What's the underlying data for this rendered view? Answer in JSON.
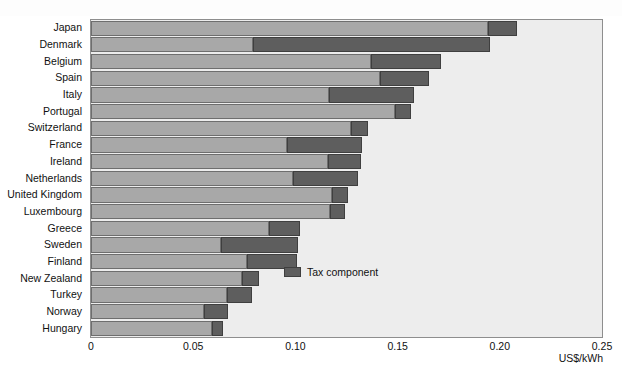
{
  "chart": {
    "type": "bar",
    "orientation": "horizontal",
    "xlabel": "US$/kWh",
    "ylabel": "",
    "title": "",
    "xlim": [
      0,
      0.25
    ],
    "xticks": [
      "0",
      "0.05",
      "0.10",
      "0.15",
      "0.20",
      "0.25"
    ],
    "xtick_values": [
      0,
      0.05,
      0.1,
      0.15,
      0.2,
      0.25
    ],
    "grid": false,
    "legend": {
      "position": "inside-center-right",
      "entries": [
        {
          "label": "Tax component",
          "color": "#5e5e5e"
        }
      ]
    },
    "colors": {
      "base": "#a8a8a8",
      "tax": "#5e5e5e",
      "plot_background": "#ededed",
      "frame": "#8e8e8e"
    },
    "series": [
      {
        "name": "Price excluding tax",
        "color": "#a8a8a8"
      },
      {
        "name": "Tax component",
        "color": "#5e5e5e"
      }
    ],
    "categories": [
      "Japan",
      "Denmark",
      "Belgium",
      "Spain",
      "Italy",
      "Portugal",
      "Switzerland",
      "France",
      "Ireland",
      "Netherlands",
      "United Kingdom",
      "Luxembourg",
      "Greece",
      "Sweden",
      "Finland",
      "New Zealand",
      "Turkey",
      "Norway",
      "Hungary"
    ],
    "rows": [
      {
        "category": "Japan",
        "base": 0.1944,
        "tax": 0.0142,
        "total": 0.2086
      },
      {
        "category": "Denmark",
        "base": 0.0794,
        "tax": 0.116,
        "total": 0.1954
      },
      {
        "category": "Belgium",
        "base": 0.1369,
        "tax": 0.0341,
        "total": 0.171
      },
      {
        "category": "Spain",
        "base": 0.1413,
        "tax": 0.0239,
        "total": 0.1652
      },
      {
        "category": "Italy",
        "base": 0.1165,
        "tax": 0.0414,
        "total": 0.1579
      },
      {
        "category": "Portugal",
        "base": 0.1486,
        "tax": 0.0078,
        "total": 0.1564
      },
      {
        "category": "Switzerland",
        "base": 0.1272,
        "tax": 0.0083,
        "total": 0.1355
      },
      {
        "category": "France",
        "base": 0.096,
        "tax": 0.0366,
        "total": 0.1326
      },
      {
        "category": "Ireland",
        "base": 0.116,
        "tax": 0.0161,
        "total": 0.1321
      },
      {
        "category": "Netherlands",
        "base": 0.0989,
        "tax": 0.0317,
        "total": 0.1306
      },
      {
        "category": "United Kingdom",
        "base": 0.1179,
        "tax": 0.0078,
        "total": 0.1257
      },
      {
        "category": "Luxembourg",
        "base": 0.1169,
        "tax": 0.0073,
        "total": 0.1242
      },
      {
        "category": "Greece",
        "base": 0.0872,
        "tax": 0.0151,
        "total": 0.1023
      },
      {
        "category": "Sweden",
        "base": 0.0638,
        "tax": 0.0375,
        "total": 0.1013
      },
      {
        "category": "Finland",
        "base": 0.0765,
        "tax": 0.0244,
        "total": 0.1009
      },
      {
        "category": "New Zealand",
        "base": 0.0741,
        "tax": 0.0083,
        "total": 0.0824
      },
      {
        "category": "Turkey",
        "base": 0.0663,
        "tax": 0.0127,
        "total": 0.079
      },
      {
        "category": "Norway",
        "base": 0.0551,
        "tax": 0.0117,
        "total": 0.0668
      },
      {
        "category": "Hungary",
        "base": 0.059,
        "tax": 0.0054,
        "total": 0.0644
      }
    ]
  }
}
